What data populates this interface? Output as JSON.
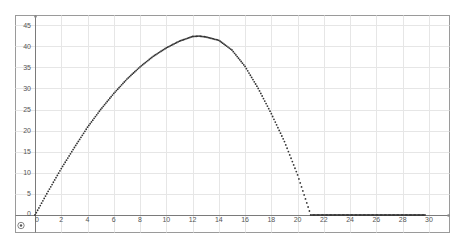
{
  "chart_data": {
    "type": "scatter",
    "title": "",
    "xlabel": "",
    "ylabel": "",
    "xlim": [
      0,
      31.5
    ],
    "ylim": [
      0,
      47.5
    ],
    "grid": true,
    "legend": null,
    "x_ticks": [
      0,
      2,
      4,
      6,
      8,
      10,
      12,
      14,
      16,
      18,
      20,
      22,
      24,
      26,
      28,
      30
    ],
    "y_ticks": [
      0,
      5,
      10,
      15,
      20,
      25,
      30,
      35,
      40,
      45
    ],
    "series": [
      {
        "name": "trajectory",
        "style": "dotted-points",
        "color": "#333333",
        "points": [
          [
            0,
            0
          ],
          [
            1,
            5.6
          ],
          [
            2,
            11.0
          ],
          [
            3,
            16.0
          ],
          [
            4,
            20.8
          ],
          [
            5,
            25.0
          ],
          [
            6,
            28.8
          ],
          [
            7,
            32.2
          ],
          [
            8,
            35.1
          ],
          [
            9,
            37.6
          ],
          [
            10,
            39.6
          ],
          [
            11,
            41.2
          ],
          [
            12,
            42.3
          ],
          [
            12.5,
            42.4
          ],
          [
            13,
            42.2
          ],
          [
            14,
            41.4
          ],
          [
            15,
            39.1
          ],
          [
            16,
            35.2
          ],
          [
            17,
            30.0
          ],
          [
            18,
            24.0
          ],
          [
            19,
            17.4
          ],
          [
            20,
            9.5
          ],
          [
            21,
            0
          ],
          [
            22,
            0
          ],
          [
            24,
            0
          ],
          [
            26,
            0
          ],
          [
            28,
            0
          ],
          [
            29.7,
            0
          ]
        ]
      }
    ]
  },
  "ui": {
    "corner_icon": "origin-target-icon"
  }
}
